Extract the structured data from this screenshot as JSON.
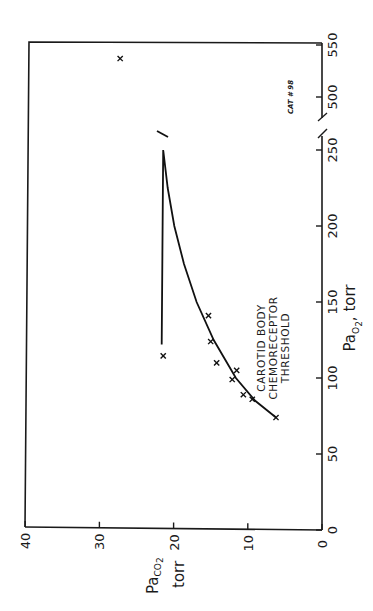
{
  "figure": {
    "orientation": "rotated-90-ccw",
    "label": "CAT # 98",
    "annotation_lines": [
      "CAROTID BODY",
      "CHEMORECEPTOR",
      "THRESHOLD"
    ],
    "x_axis": {
      "title_main": "Pa",
      "title_sub": "O",
      "title_subsub": "2",
      "title_units": ", torr",
      "ticks": [
        "0",
        "50",
        "100",
        "150",
        "200",
        "250",
        "500",
        "550"
      ]
    },
    "y_axis": {
      "title_main": "Pa",
      "title_sub": "CO",
      "title_subsub": "2",
      "title_units": "torr",
      "ticks": [
        "0",
        "10",
        "20",
        "30",
        "40"
      ]
    },
    "colors": {
      "ink": "#111111",
      "background": "#ffffff"
    }
  },
  "chart_data": {
    "type": "scatter",
    "title": "",
    "xlabel": "PaO2, torr",
    "ylabel": "PaCO2 torr",
    "annotations": [
      "CAROTID BODY CHEMORECEPTOR THRESHOLD",
      "CAT # 98"
    ],
    "xlim": [
      0,
      550
    ],
    "x_axis_break": [
      250,
      500
    ],
    "ylim": [
      0,
      40
    ],
    "x_ticks": [
      0,
      50,
      100,
      150,
      200,
      250,
      500,
      550
    ],
    "y_ticks": [
      0,
      10,
      20,
      30,
      40
    ],
    "grid": false,
    "legend": null,
    "series": [
      {
        "name": "Observations",
        "marker": "x",
        "points": [
          {
            "x": 74,
            "y": 6.2
          },
          {
            "x": 86,
            "y": 9.4
          },
          {
            "x": 89,
            "y": 10.6
          },
          {
            "x": 99,
            "y": 12.1
          },
          {
            "x": 105,
            "y": 11.5
          },
          {
            "x": 110,
            "y": 14.2
          },
          {
            "x": 124,
            "y": 15.0
          },
          {
            "x": 141,
            "y": 15.3
          },
          {
            "x": 251,
            "y": 21.4
          },
          {
            "x": 537,
            "y": 27.2
          }
        ]
      },
      {
        "name": "Fitted curve",
        "type": "line",
        "points": [
          {
            "x": 74,
            "y": 6.2
          },
          {
            "x": 85,
            "y": 9.0
          },
          {
            "x": 100,
            "y": 11.6
          },
          {
            "x": 125,
            "y": 14.6
          },
          {
            "x": 150,
            "y": 16.9
          },
          {
            "x": 175,
            "y": 18.6
          },
          {
            "x": 200,
            "y": 19.9
          },
          {
            "x": 225,
            "y": 20.8
          },
          {
            "x": 250,
            "y": 21.4
          },
          {
            "x": 262,
            "y": 21.6
          }
        ]
      }
    ]
  }
}
